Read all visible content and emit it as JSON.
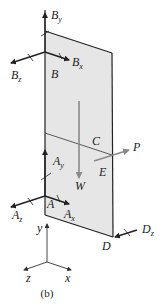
{
  "diagram": {
    "caption": "(b)",
    "panel": {
      "fill": "#e6e6e6",
      "stroke": "#222222"
    },
    "points": {
      "B": "B",
      "A": "A",
      "C": "C",
      "D": "D",
      "E": "E"
    },
    "forces": {
      "By": {
        "base": "B",
        "sub": "y"
      },
      "Bx": {
        "base": "B",
        "sub": "x"
      },
      "Bz": {
        "base": "B",
        "sub": "z"
      },
      "Ay": {
        "base": "A",
        "sub": "y"
      },
      "Ax": {
        "base": "A",
        "sub": "x"
      },
      "Az": {
        "base": "A",
        "sub": "z"
      },
      "Dz": {
        "base": "D",
        "sub": "z"
      },
      "W": "W",
      "P": "P"
    },
    "axes": {
      "x": "x",
      "y": "y",
      "z": "z"
    },
    "colors": {
      "reaction": "#222222",
      "load": "#8a8a8a"
    }
  }
}
